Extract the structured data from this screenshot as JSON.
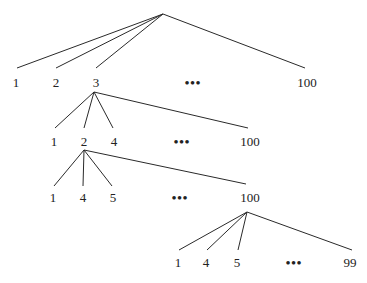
{
  "tree": {
    "levels": [
      {
        "parent": [
          163,
          14
        ],
        "y": 82,
        "children": [
          {
            "label": "1",
            "x": 16,
            "lx": 17,
            "ly": 68
          },
          {
            "label": "2",
            "x": 56,
            "lx": 56,
            "ly": 68
          },
          {
            "label": "3",
            "x": 96,
            "lx": 96,
            "ly": 68
          },
          {
            "label": "•••",
            "x": 193,
            "dots": true
          },
          {
            "label": "100",
            "x": 307,
            "lx": 305,
            "ly": 68
          }
        ]
      },
      {
        "parent": [
          94,
          92
        ],
        "y": 141,
        "children": [
          {
            "label": "1",
            "x": 54,
            "lx": 55,
            "ly": 128
          },
          {
            "label": "2",
            "x": 84,
            "lx": 84,
            "ly": 128
          },
          {
            "label": "4",
            "x": 114,
            "lx": 113,
            "ly": 128
          },
          {
            "label": "•••",
            "x": 182,
            "dots": true
          },
          {
            "label": "100",
            "x": 250,
            "lx": 248,
            "ly": 128
          }
        ]
      },
      {
        "parent": [
          84,
          150
        ],
        "y": 197,
        "children": [
          {
            "label": "1",
            "x": 53,
            "lx": 54,
            "ly": 186
          },
          {
            "label": "4",
            "x": 83,
            "lx": 83,
            "ly": 186
          },
          {
            "label": "5",
            "x": 113,
            "lx": 112,
            "ly": 186
          },
          {
            "label": "•••",
            "x": 180,
            "dots": true
          },
          {
            "label": "100",
            "x": 250,
            "lx": 246,
            "ly": 184
          }
        ]
      },
      {
        "parent": [
          247,
          212
        ],
        "y": 262,
        "children": [
          {
            "label": "1",
            "x": 178,
            "lx": 179,
            "ly": 250
          },
          {
            "label": "4",
            "x": 206,
            "lx": 207,
            "ly": 250
          },
          {
            "label": "5",
            "x": 237,
            "lx": 238,
            "ly": 250
          },
          {
            "label": "•••",
            "x": 294,
            "dots": true
          },
          {
            "label": "99",
            "x": 350,
            "lx": 352,
            "ly": 250
          }
        ]
      }
    ]
  }
}
